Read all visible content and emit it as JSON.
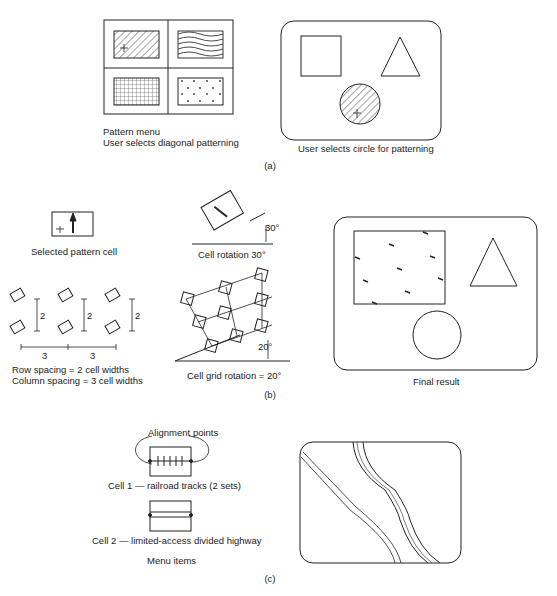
{
  "panel_a": {
    "caption": "(a)",
    "menu_label_1": "Pattern menu",
    "menu_label_2": "User selects diagonal patterning",
    "screen_label": "User selects circle for patterning",
    "patterns": [
      "diagonal-hatch",
      "wavy-lines",
      "grid",
      "dots-plus"
    ]
  },
  "panel_b": {
    "caption": "(b)",
    "selected_cell_label": "Selected pattern cell",
    "cell_rotation_label": "Cell rotation 30°",
    "cell_rotation_angle": "30°",
    "row_spacing_value": "2",
    "column_spacing_value": "3",
    "row_spacing_label": "Row spacing = 2 cell widths",
    "column_spacing_label": "Column spacing = 3 cell widths",
    "grid_rotation_angle": "20°",
    "grid_rotation_label": "Cell grid rotation = 20°",
    "final_label": "Final result"
  },
  "panel_c": {
    "caption": "(c)",
    "alignment_label": "Alignment points",
    "cell1_label": "Cell 1 — railroad tracks (2 sets)",
    "cell2_label": "Cell 2 — limited-access divided highway",
    "menu_label": "Menu items"
  }
}
